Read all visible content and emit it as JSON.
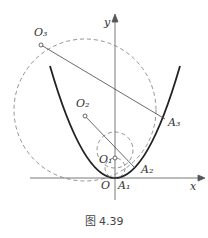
{
  "figure": {
    "caption": "图 4.39",
    "labels": {
      "y": "y",
      "x": "x",
      "O": "O",
      "O1": "O₁",
      "O2": "O₂",
      "O3": "O₃",
      "A1": "A₁",
      "A2": "A₂",
      "A3": "A₃"
    }
  }
}
